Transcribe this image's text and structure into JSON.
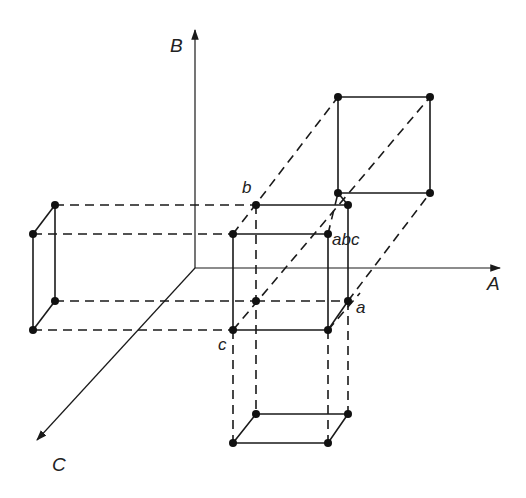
{
  "diagram": {
    "type": "3D factorial design cube with projections onto axis planes",
    "axes": [
      {
        "name": "A",
        "label": "A",
        "from": [
          195,
          268
        ],
        "to": [
          500,
          268
        ],
        "label_pos": [
          487,
          290
        ]
      },
      {
        "name": "B",
        "label": "B",
        "from": [
          195,
          268
        ],
        "to": [
          195,
          30
        ],
        "label_pos": [
          170,
          52
        ]
      },
      {
        "name": "C",
        "label": "C",
        "from": [
          195,
          268
        ],
        "to": [
          37,
          440
        ],
        "label_pos": [
          52,
          471
        ]
      }
    ],
    "vertex_labels": [
      {
        "text": "b",
        "pos": [
          242,
          193
        ]
      },
      {
        "text": "abc",
        "pos": [
          332,
          245
        ]
      },
      {
        "text": "a",
        "pos": [
          356,
          313
        ]
      },
      {
        "text": "c",
        "pos": [
          218,
          350
        ]
      }
    ],
    "colors": {
      "line": "#1a1a1a",
      "dot": "#111111",
      "text": "#222222",
      "background": "#ffffff"
    },
    "main_cube": {
      "front": [
        [
          233,
          234
        ],
        [
          328,
          234
        ],
        [
          328,
          330
        ],
        [
          233,
          330
        ]
      ],
      "back": [
        [
          256,
          205
        ],
        [
          348,
          205
        ],
        [
          348,
          301
        ],
        [
          256,
          301
        ]
      ]
    },
    "projection_top_right": [
      [
        338,
        97
      ],
      [
        430,
        97
      ],
      [
        430,
        193
      ],
      [
        338,
        193
      ]
    ],
    "projection_left": {
      "back": [
        [
          55,
          205
        ],
        [
          55,
          301
        ]
      ],
      "front": [
        [
          33,
          234
        ],
        [
          33,
          330
        ]
      ]
    },
    "projection_bottom": {
      "back": [
        [
          256,
          414
        ],
        [
          348,
          414
        ]
      ],
      "front": [
        [
          233,
          443
        ],
        [
          328,
          443
        ]
      ]
    }
  }
}
